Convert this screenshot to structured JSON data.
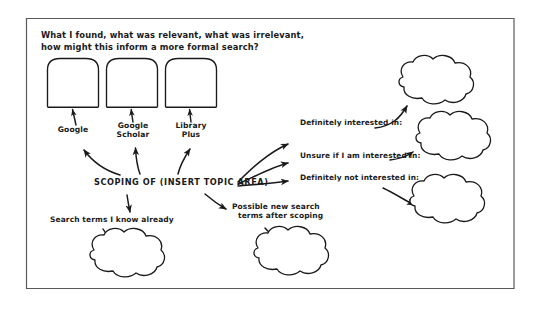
{
  "diagram": {
    "title_lines": [
      "What I found, what was relevant, what was irrelevant,",
      "how might this inform a more formal search?"
    ],
    "center_node": "SCOPING OF (INSERT TOPIC AREA)",
    "sources": [
      {
        "label_lines": [
          "Google"
        ]
      },
      {
        "label_lines": [
          "Google",
          "Scholar"
        ]
      },
      {
        "label_lines": [
          "Library",
          "Plus"
        ]
      }
    ],
    "interest_categories": [
      {
        "label": "Definitely interested in:"
      },
      {
        "label": "Unsure if I am interested in:"
      },
      {
        "label": "Definitely not interested in:"
      }
    ],
    "search_terms": [
      {
        "label_lines": [
          "Search terms I know already"
        ]
      },
      {
        "label_lines": [
          "Possible new search",
          "terms after scoping"
        ]
      }
    ],
    "boxes_count": 3,
    "clouds_count": 5,
    "ink_color": "#1a1a1a",
    "background_color": "#ffffff",
    "frame_color": "#555555"
  }
}
